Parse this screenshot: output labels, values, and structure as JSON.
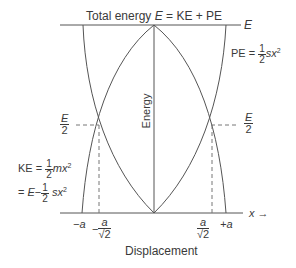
{
  "diagram": {
    "title": "Total energy",
    "title_eq_E": "E",
    "title_eq_rest": "= KE + PE",
    "top_line_label": "E",
    "pe_label_prefix": "PE =",
    "pe_num": "1",
    "pe_den": "2",
    "pe_suffix": "sx",
    "pe_exp": "2",
    "half_energy_left_num": "E",
    "half_energy_left_den": "2",
    "half_energy_right_num": "E",
    "half_energy_right_den": "2",
    "ke_label_prefix": "KE =",
    "ke_num": "1",
    "ke_den": "2",
    "ke_suffix": "mx",
    "ke_exp": "2",
    "ke_alt_prefix": "=",
    "ke_alt_E": "E",
    "ke_alt_minus": "−",
    "ke_alt_num": "1",
    "ke_alt_den": "2",
    "ke_alt_suffix": "sx",
    "ke_alt_exp": "2",
    "energy_axis_label": "Energy",
    "x_axis_label": "x",
    "x_arrow": "→",
    "tick_neg_a": "−a",
    "tick_neg_a_root2_sign": "−",
    "tick_neg_a_root2_num": "a",
    "tick_neg_a_root2_den": "2",
    "tick_pos_a_root2_num": "a",
    "tick_pos_a_root2_den": "2",
    "tick_pos_a": "+a",
    "sqrt_symbol": "√",
    "bottom_label": "Displacement"
  }
}
